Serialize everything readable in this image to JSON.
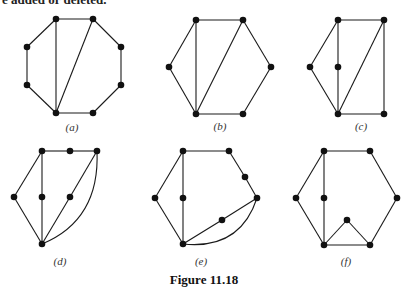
{
  "top_text": "e added or deleted.",
  "caption": "Figure 11.18",
  "colors": {
    "ink": "#111111",
    "background": "#ffffff"
  },
  "panels": [
    {
      "label": "(a)",
      "label_pos": [
        72,
        131
      ],
      "nodes": [
        [
          56,
          19
        ],
        [
          93,
          19
        ],
        [
          121,
          47
        ],
        [
          121,
          85
        ],
        [
          93,
          113
        ],
        [
          56,
          113
        ],
        [
          27,
          85
        ],
        [
          27,
          47
        ]
      ],
      "edges": [
        [
          0,
          1
        ],
        [
          1,
          2
        ],
        [
          2,
          3
        ],
        [
          3,
          4
        ],
        [
          4,
          5
        ],
        [
          5,
          6
        ],
        [
          6,
          7
        ],
        [
          7,
          0
        ],
        [
          0,
          5
        ],
        [
          1,
          5
        ]
      ],
      "curves": []
    },
    {
      "label": "(b)",
      "label_pos": [
        220,
        130
      ],
      "nodes": [
        [
          196,
          20
        ],
        [
          243,
          20
        ],
        [
          271,
          67
        ],
        [
          243,
          114
        ],
        [
          196,
          114
        ],
        [
          169,
          67
        ]
      ],
      "edges": [
        [
          0,
          1
        ],
        [
          1,
          2
        ],
        [
          2,
          3
        ],
        [
          3,
          4
        ],
        [
          4,
          5
        ],
        [
          5,
          0
        ],
        [
          0,
          4
        ],
        [
          1,
          4
        ]
      ],
      "curves": []
    },
    {
      "label": "(c)",
      "label_pos": [
        361,
        130
      ],
      "nodes": [
        [
          338,
          20
        ],
        [
          384,
          20
        ],
        [
          384,
          114
        ],
        [
          338,
          114
        ],
        [
          310,
          67
        ],
        [
          338,
          67
        ]
      ],
      "edges": [
        [
          0,
          1
        ],
        [
          1,
          2
        ],
        [
          2,
          3
        ],
        [
          3,
          4
        ],
        [
          4,
          0
        ],
        [
          0,
          5
        ],
        [
          5,
          3
        ],
        [
          1,
          3
        ]
      ],
      "curves": []
    },
    {
      "label": "(d)",
      "label_pos": [
        60,
        265
      ],
      "nodes": [
        [
          42,
          151
        ],
        [
          70,
          151
        ],
        [
          97,
          151
        ],
        [
          14,
          197
        ],
        [
          42,
          197
        ],
        [
          70,
          197
        ],
        [
          42,
          244
        ]
      ],
      "edges": [
        [
          0,
          1
        ],
        [
          1,
          2
        ],
        [
          0,
          3
        ],
        [
          3,
          6
        ],
        [
          0,
          4
        ],
        [
          4,
          6
        ],
        [
          2,
          5
        ],
        [
          5,
          6
        ]
      ],
      "curves": [
        {
          "from": 2,
          "to": 6,
          "ctrl": [
            100,
            220
          ]
        }
      ]
    },
    {
      "label": "(e)",
      "label_pos": [
        201,
        265
      ],
      "nodes": [
        [
          183,
          151
        ],
        [
          229,
          151
        ],
        [
          245,
          177
        ],
        [
          257,
          198
        ],
        [
          155,
          198
        ],
        [
          183,
          198
        ],
        [
          222,
          220
        ],
        [
          183,
          244
        ]
      ],
      "edges": [
        [
          0,
          1
        ],
        [
          1,
          2
        ],
        [
          2,
          3
        ],
        [
          0,
          4
        ],
        [
          4,
          7
        ],
        [
          0,
          5
        ],
        [
          5,
          7
        ],
        [
          3,
          6
        ],
        [
          6,
          7
        ]
      ],
      "curves": [
        {
          "from": 3,
          "to": 7,
          "ctrl": [
            240,
            250
          ]
        }
      ]
    },
    {
      "label": "(f)",
      "label_pos": [
        346,
        265
      ],
      "nodes": [
        [
          324,
          151
        ],
        [
          370,
          151
        ],
        [
          397,
          198
        ],
        [
          370,
          245
        ],
        [
          324,
          245
        ],
        [
          296,
          198
        ],
        [
          324,
          198
        ],
        [
          347,
          220
        ]
      ],
      "edges": [
        [
          0,
          1
        ],
        [
          1,
          2
        ],
        [
          2,
          3
        ],
        [
          3,
          4
        ],
        [
          4,
          5
        ],
        [
          5,
          0
        ],
        [
          0,
          6
        ],
        [
          6,
          4
        ],
        [
          4,
          7
        ],
        [
          7,
          3
        ]
      ],
      "curves": []
    }
  ]
}
